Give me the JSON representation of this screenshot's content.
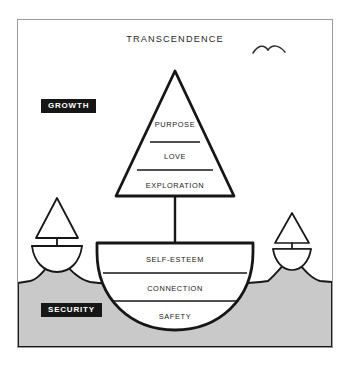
{
  "diagram": {
    "title": "TRANSCENDENCE",
    "badges": [
      {
        "key": "growth",
        "label": "GROWTH"
      },
      {
        "key": "security",
        "label": "SECURITY"
      }
    ],
    "sail": {
      "name": "growth-sail",
      "tiers": [
        {
          "label": "PURPOSE"
        },
        {
          "label": "LOVE"
        },
        {
          "label": "EXPLORATION"
        }
      ]
    },
    "hull": {
      "name": "security-hull",
      "tiers": [
        {
          "label": "SELF-ESTEEM"
        },
        {
          "label": "CONNECTION"
        },
        {
          "label": "SAFETY"
        }
      ]
    },
    "decorations": {
      "birds": "seagull-icon",
      "small_boat_left": "small-sailboat-icon",
      "small_boat_right": "small-sailboat-icon",
      "water": "water-ground-shape",
      "mast": "mast-line"
    },
    "colors": {
      "ink": "#161616",
      "water": "#c9c9c9",
      "frame": "#9a9a9a",
      "background": "#ffffff",
      "badge_text": "#ffffff"
    }
  }
}
